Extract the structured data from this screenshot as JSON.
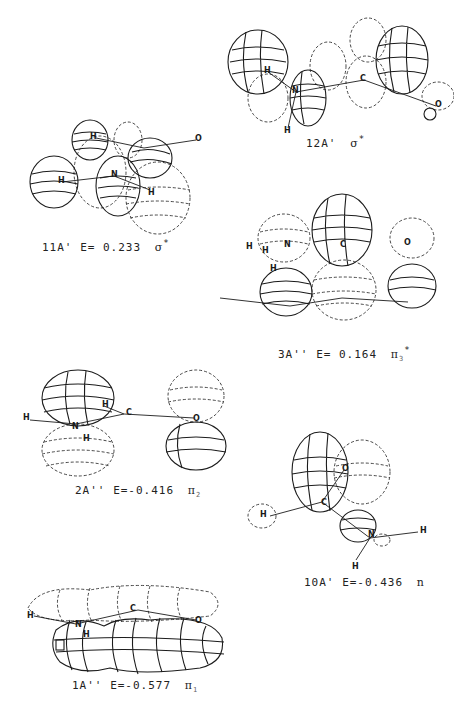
{
  "figure": {
    "panels": [
      {
        "id": "12A'",
        "label": "12A'",
        "energy": "",
        "symbol": "σ",
        "sup": "*",
        "sub": "",
        "atoms": [
          "H",
          "C",
          "H",
          "N",
          "O"
        ]
      },
      {
        "id": "11A'",
        "label": "11A'",
        "energy": "E= 0.233",
        "symbol": "σ",
        "sup": "*",
        "sub": "",
        "atoms": [
          "H",
          "O",
          "H",
          "N",
          "H"
        ]
      },
      {
        "id": "3A''",
        "label": "3A''",
        "energy": "E= 0.164",
        "symbol": "π",
        "sup": "*",
        "sub": "3",
        "atoms": [
          "H",
          "N",
          "H",
          "C",
          "O",
          "H"
        ]
      },
      {
        "id": "2A''",
        "label": "2A''",
        "energy": "E=-0.416",
        "symbol": "π",
        "sup": "",
        "sub": "2",
        "atoms": [
          "H",
          "N",
          "H",
          "C",
          "O",
          "H"
        ]
      },
      {
        "id": "10A'",
        "label": "10A'",
        "energy": "E=-0.436",
        "symbol": "n",
        "sup": "",
        "sub": "",
        "atoms": [
          "O",
          "C",
          "H",
          "N",
          "H",
          "H"
        ]
      },
      {
        "id": "1A''",
        "label": "1A''",
        "energy": "E=-0.577",
        "symbol": "π",
        "sup": "",
        "sub": "1",
        "atoms": [
          "H",
          "N",
          "H",
          "C",
          "O"
        ]
      }
    ]
  }
}
